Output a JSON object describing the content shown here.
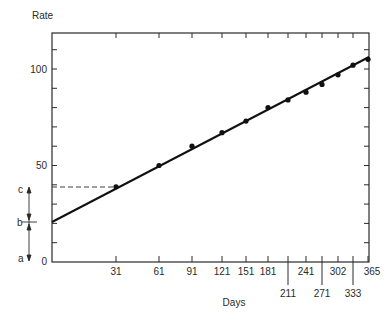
{
  "chart_data": {
    "type": "line",
    "title": "",
    "ylabel": "Rate",
    "xlabel": "Days",
    "ylim": [
      0,
      118
    ],
    "xlim": [
      0,
      365
    ],
    "grid": false,
    "legend": null,
    "y_ticks": {
      "labeled": [
        0,
        50,
        100
      ],
      "minor_step": 10
    },
    "x_ticks": {
      "upper_row": [
        31,
        61,
        91,
        121,
        151,
        181,
        241,
        302,
        365
      ],
      "lower_row": [
        211,
        271,
        333
      ],
      "all": [
        31,
        61,
        91,
        121,
        151,
        181,
        211,
        241,
        271,
        302,
        333,
        365
      ]
    },
    "x_axis_note": "x-axis is non-linear (compressed toward later days)",
    "series": [
      {
        "name": "measured",
        "kind": "scatter+fit-line",
        "x": [
          31,
          61,
          91,
          121,
          151,
          181,
          211,
          241,
          271,
          302,
          333,
          365
        ],
        "values": [
          39,
          50,
          60,
          67,
          73,
          80,
          84,
          88,
          92,
          97,
          102,
          105
        ]
      }
    ],
    "fit_line": {
      "y_at_origin": 21,
      "y_at_end": 106
    },
    "annotations": {
      "dashed_line": {
        "from_y_axis_at": 39,
        "to_x": 31
      },
      "bracket_labels": [
        {
          "label": "c",
          "value": 39
        },
        {
          "label": "b",
          "value": 21
        },
        {
          "label": "a",
          "value": 0
        }
      ]
    }
  },
  "labels": {
    "y_axis_title": "Rate",
    "x_axis_title": "Days",
    "y_tick_0": "0",
    "y_tick_50": "50",
    "y_tick_100": "100",
    "c": "c",
    "b": "b",
    "a": "a"
  }
}
